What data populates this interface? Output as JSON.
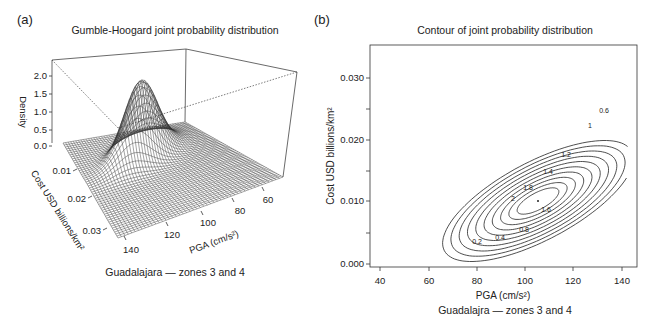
{
  "figure": {
    "panel_a": {
      "label": "(a)",
      "title": "Gumble-Hoogard joint probability distribution",
      "caption": "Guadalajara — zones 3 and 4",
      "z_axis_label": "Density",
      "z_ticks": [
        "0.0",
        "0.5",
        "1.0",
        "1.5",
        "2.0"
      ],
      "y_axis_label": "Cost USD billions/km²",
      "y_ticks": [
        "0.01",
        "0.02",
        "0.03"
      ],
      "x_axis_label": "PGA (cm/s²)",
      "x_ticks": [
        "140",
        "120",
        "100",
        "80",
        "60"
      ]
    },
    "panel_b": {
      "label": "(b)",
      "title": "Contour of joint probability distribution",
      "xlabel": "PGA (cm/s²)",
      "caption": "Guadalajra — zones 3 and 4",
      "ylabel": "Cost USD billions/km²",
      "x_ticks": [
        "40",
        "60",
        "80",
        "100",
        "120",
        "140"
      ],
      "y_ticks": [
        "0.000",
        "0.010",
        "0.020",
        "0.030"
      ],
      "contour_labels": [
        "0.2",
        "0.4",
        "0.6",
        "0.8",
        "1",
        "1.2",
        "1.4",
        "1.6",
        "1.8",
        "2"
      ]
    }
  },
  "chart_data": [
    {
      "type": "surface3d",
      "title": "Gumble-Hoogard joint probability distribution",
      "xlabel": "PGA (cm/s²)",
      "ylabel": "Cost USD billions/km²",
      "zlabel": "Density",
      "x_range": [
        50,
        145
      ],
      "y_range": [
        0.0,
        0.035
      ],
      "z_range": [
        0.0,
        2.3
      ],
      "x_ticks": [
        140,
        120,
        100,
        80,
        60
      ],
      "y_ticks": [
        0.01,
        0.02,
        0.03
      ],
      "z_ticks": [
        0.0,
        0.5,
        1.0,
        1.5,
        2.0
      ],
      "peak": {
        "x": 101,
        "y": 0.01,
        "z": 2.2
      },
      "caption": "Guadalajara — zones 3 and 4"
    },
    {
      "type": "contour",
      "title": "Contour of joint probability distribution",
      "xlabel": "PGA (cm/s²)",
      "ylabel": "Cost USD billions/km²",
      "xlim": [
        36,
        146
      ],
      "ylim": [
        -0.001,
        0.035
      ],
      "x_ticks": [
        40,
        60,
        80,
        100,
        120,
        140
      ],
      "y_ticks": [
        0.0,
        0.01,
        0.02,
        0.03
      ],
      "levels": [
        0.2,
        0.4,
        0.6,
        0.8,
        1.0,
        1.2,
        1.4,
        1.6,
        1.8,
        2.0
      ],
      "peak": {
        "x": 102,
        "y": 0.01,
        "z": 2.2
      },
      "grid": false,
      "caption": "Guadalajra — zones 3 and 4"
    }
  ]
}
